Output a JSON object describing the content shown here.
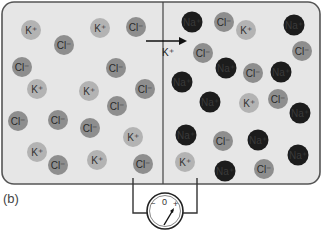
{
  "figure": {
    "caption": "(b)",
    "colors": {
      "box_fill": "#e6e6e6",
      "box_stroke": "#555555",
      "k_ion": "#b3b3b3",
      "cl_ion": "#8e8e8e",
      "na_ion": "#1c1c1c",
      "wire": "#333333"
    },
    "arrow": {
      "label": "K⁺",
      "direction": "left-to-right"
    },
    "voltmeter": {
      "zero": "0",
      "minus": "−",
      "plus": "+"
    },
    "left_compartment": {
      "ions": [
        {
          "type": "K",
          "label": "K⁺",
          "x": 31,
          "y": 30
        },
        {
          "type": "Cl",
          "label": "Cl⁻",
          "x": 64,
          "y": 45
        },
        {
          "type": "Cl",
          "label": "Cl⁻",
          "x": 22,
          "y": 67
        },
        {
          "type": "K",
          "label": "K⁺",
          "x": 100,
          "y": 28
        },
        {
          "type": "Cl",
          "label": "Cl⁻",
          "x": 136,
          "y": 27
        },
        {
          "type": "Cl",
          "label": "Cl⁻",
          "x": 116,
          "y": 68
        },
        {
          "type": "K",
          "label": "K⁺",
          "x": 37,
          "y": 89
        },
        {
          "type": "K",
          "label": "K⁺",
          "x": 89,
          "y": 91
        },
        {
          "type": "Cl",
          "label": "Cl⁻",
          "x": 145,
          "y": 89
        },
        {
          "type": "Cl",
          "label": "Cl⁻",
          "x": 117,
          "y": 106
        },
        {
          "type": "Cl",
          "label": "Cl⁻",
          "x": 18,
          "y": 121
        },
        {
          "type": "Cl",
          "label": "Cl⁻",
          "x": 58,
          "y": 120
        },
        {
          "type": "Cl",
          "label": "Cl⁻",
          "x": 90,
          "y": 128
        },
        {
          "type": "K",
          "label": "K⁺",
          "x": 133,
          "y": 137
        },
        {
          "type": "K",
          "label": "K⁺",
          "x": 37,
          "y": 152
        },
        {
          "type": "Cl",
          "label": "Cl⁻",
          "x": 58,
          "y": 165
        },
        {
          "type": "K",
          "label": "K⁺",
          "x": 97,
          "y": 160
        },
        {
          "type": "Cl",
          "label": "Cl⁻",
          "x": 143,
          "y": 164
        }
      ]
    },
    "right_compartment": {
      "ions": [
        {
          "type": "Na",
          "label": "Na⁺",
          "x": 192,
          "y": 22
        },
        {
          "type": "Cl",
          "label": "Cl⁻",
          "x": 224,
          "y": 22
        },
        {
          "type": "K",
          "label": "K⁺",
          "x": 246,
          "y": 30
        },
        {
          "type": "Na",
          "label": "Na⁺",
          "x": 294,
          "y": 25
        },
        {
          "type": "Cl",
          "label": "Cl⁻",
          "x": 203,
          "y": 53
        },
        {
          "type": "Cl",
          "label": "Cl⁻",
          "x": 302,
          "y": 51
        },
        {
          "type": "Na",
          "label": "Na⁺",
          "x": 226,
          "y": 68
        },
        {
          "type": "Cl",
          "label": "Cl⁻",
          "x": 253,
          "y": 73
        },
        {
          "type": "Na",
          "label": "Na⁺",
          "x": 281,
          "y": 72
        },
        {
          "type": "Na",
          "label": "Na⁺",
          "x": 182,
          "y": 82
        },
        {
          "type": "K",
          "label": "K⁺",
          "x": 249,
          "y": 103
        },
        {
          "type": "Cl",
          "label": "Cl⁻",
          "x": 278,
          "y": 99
        },
        {
          "type": "Na",
          "label": "Na⁺",
          "x": 210,
          "y": 102
        },
        {
          "type": "Na",
          "label": "Na⁺",
          "x": 300,
          "y": 113
        },
        {
          "type": "Na",
          "label": "Na⁺",
          "x": 186,
          "y": 135
        },
        {
          "type": "Cl",
          "label": "Cl⁻",
          "x": 223,
          "y": 141
        },
        {
          "type": "Na",
          "label": "Na⁺",
          "x": 258,
          "y": 140
        },
        {
          "type": "Na",
          "label": "Na⁺",
          "x": 298,
          "y": 155
        },
        {
          "type": "K",
          "label": "K⁺",
          "x": 185,
          "y": 162
        },
        {
          "type": "Cl",
          "label": "Cl⁻",
          "x": 264,
          "y": 169
        },
        {
          "type": "Na",
          "label": "Na⁺",
          "x": 225,
          "y": 171
        }
      ]
    }
  }
}
